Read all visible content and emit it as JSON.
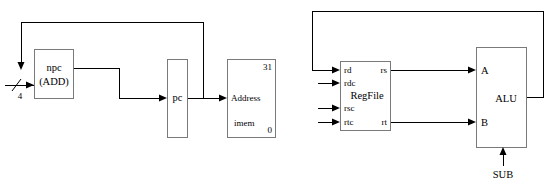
{
  "diagram": {
    "colors": {
      "background": "#ffffff",
      "box_stroke": "#7a7a7a",
      "wire_stroke": "#000000",
      "text": "#000000"
    },
    "left_section": {
      "blocks": {
        "npc": {
          "label_line1": "npc",
          "label_line2": "(ADD)"
        },
        "pc": {
          "label": "pc"
        },
        "imem": {
          "port_label": "Address",
          "name_label": "imem",
          "msb_label": "31",
          "lsb_label": "0"
        }
      },
      "signals": {
        "constant_four": "4"
      }
    },
    "right_section": {
      "blocks": {
        "regfile": {
          "name_label": "RegFile",
          "input_ports": [
            "rd",
            "rdc",
            "rsc",
            "rtc"
          ],
          "output_ports": [
            "rs",
            "rt"
          ]
        },
        "alu": {
          "name_label": "ALU",
          "input_ports": [
            "A",
            "B"
          ],
          "control_port": "SUB"
        }
      },
      "signals": {
        "control_sub": "SUB"
      }
    }
  }
}
